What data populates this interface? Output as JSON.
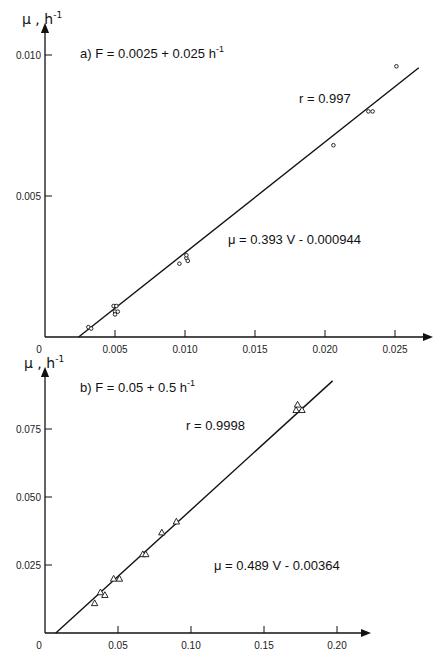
{
  "chart_data": [
    {
      "type": "scatter",
      "panel": "a",
      "title": "a) F = 0.0025 + 0.025 h⁻¹",
      "title_parts": {
        "prefix": "a)  F  =  0.0025  +  0.025  h",
        "sup": "-1"
      },
      "ylabel": "μ, h⁻¹",
      "ylabel_parts": {
        "main": "μ , h",
        "sup": "-1"
      },
      "xlabel": "",
      "xlim": [
        0,
        0.027
      ],
      "ylim": [
        0,
        0.0105
      ],
      "xticks": [
        0,
        0.005,
        0.01,
        0.015,
        0.02,
        0.025
      ],
      "xtick_labels": [
        "0",
        "0.005",
        "0.010",
        "0.015",
        "0.020",
        "0.025"
      ],
      "yticks": [
        0.005,
        0.01
      ],
      "ytick_labels": [
        "0.005",
        "0.010"
      ],
      "marker": "circle",
      "grid": false,
      "series": [
        {
          "name": "data",
          "points": [
            [
              0.0031,
              0.00035
            ],
            [
              0.0033,
              0.0003
            ],
            [
              0.0049,
              0.0011
            ],
            [
              0.0051,
              0.0011
            ],
            [
              0.005,
              0.0009
            ],
            [
              0.0052,
              0.0009
            ],
            [
              0.005,
              0.0008
            ],
            [
              0.0096,
              0.0026
            ],
            [
              0.0101,
              0.0028
            ],
            [
              0.0101,
              0.0029
            ],
            [
              0.0102,
              0.0027
            ],
            [
              0.0206,
              0.0068
            ],
            [
              0.0231,
              0.008
            ],
            [
              0.0234,
              0.008
            ],
            [
              0.0251,
              0.0096
            ]
          ]
        }
      ],
      "fit": {
        "slope": 0.393,
        "intercept": -0.000944,
        "x_range": [
          0.0024,
          0.0267
        ]
      },
      "annotations": {
        "r": "r  =  0.997",
        "equation": "μ  =  0.393  V  -  0.000944"
      }
    },
    {
      "type": "scatter",
      "panel": "b",
      "title": "b) F = 0.05 + 0.5 h⁻¹",
      "title_parts": {
        "prefix": "b)  F  =  0.05  +  0.5  h",
        "sup": "-1"
      },
      "ylabel": "μ, h⁻¹",
      "ylabel_parts": {
        "main": "μ , h",
        "sup": "-1"
      },
      "xlabel": "",
      "xlim": [
        0,
        0.22
      ],
      "ylim": [
        0,
        0.095
      ],
      "xticks": [
        0,
        0.05,
        0.1,
        0.15,
        0.2
      ],
      "xtick_labels": [
        "0",
        "0.05",
        "0.10",
        "0.15",
        "0.20"
      ],
      "yticks": [
        0.025,
        0.05,
        0.075
      ],
      "ytick_labels": [
        "0.025",
        "0.050",
        "0.075"
      ],
      "marker": "triangle",
      "grid": false,
      "series": [
        {
          "name": "data",
          "points": [
            [
              0.034,
              0.011
            ],
            [
              0.038,
              0.015
            ],
            [
              0.041,
              0.014
            ],
            [
              0.047,
              0.02
            ],
            [
              0.051,
              0.02
            ],
            [
              0.067,
              0.029
            ],
            [
              0.069,
              0.029
            ],
            [
              0.08,
              0.037
            ],
            [
              0.09,
              0.041
            ],
            [
              0.172,
              0.082
            ],
            [
              0.173,
              0.084
            ],
            [
              0.176,
              0.082
            ]
          ]
        }
      ],
      "fit": {
        "slope": 0.489,
        "intercept": -0.00364,
        "x_range": [
          0.0074,
          0.197
        ]
      },
      "annotations": {
        "r": "r  =  0.9998",
        "equation": "μ  =  0.489  V  -  0.00364"
      }
    }
  ]
}
